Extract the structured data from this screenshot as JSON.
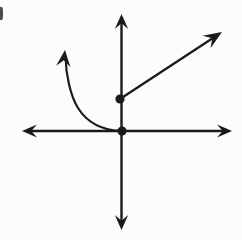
{
  "figure": {
    "kind": "coordinate-plane-graph",
    "width": 242,
    "height": 240,
    "background_color": "#fcfcfb",
    "ink_color": "#1a1a1a",
    "stroke_width": 2.2
  },
  "axes": {
    "origin": {
      "x": 121.5,
      "y": 131
    },
    "x_axis": {
      "label": "x-axis",
      "y": 131,
      "left_tip": {
        "x": 22,
        "y": 131
      },
      "right_tip": {
        "x": 232,
        "y": 131
      },
      "arrow_left": true,
      "arrow_right": true
    },
    "y_axis": {
      "label": "y-axis",
      "x": 121.5,
      "top_tip": {
        "x": 121.5,
        "y": 14
      },
      "bottom_tip": {
        "x": 121.5,
        "y": 230
      },
      "arrow_top": true,
      "arrow_bottom": true
    }
  },
  "points": [
    {
      "name": "origin-point",
      "x": 122,
      "y": 131,
      "radius": 4.6,
      "filled": true,
      "color": "#1a1a1a"
    },
    {
      "name": "y-intercept-point",
      "x": 120,
      "y": 99,
      "radius": 4.6,
      "filled": true,
      "color": "#1a1a1a"
    }
  ],
  "curves": [
    {
      "name": "exponential-decay-curve",
      "description": "Curve beginning at the origin, sweeping left nearly tangent to the x-axis, then rising steeply into the second quadrant with an arrowhead",
      "quadrant": "second",
      "path": "M 122 131 C 104 130.5 88 124 78 108 C 70 95 66 74 65.5 57",
      "arrow_end": true,
      "arrow_tip": {
        "x": 65,
        "y": 50
      },
      "arrow_angle_deg": -84
    },
    {
      "name": "linear-ray",
      "description": "Straight ray from the y-intercept point rising to the right with an arrowhead",
      "quadrant": "first",
      "path": "M 120 99 L 216 36",
      "arrow_end": true,
      "arrow_tip": {
        "x": 222,
        "y": 32
      },
      "arrow_angle_deg": -33
    }
  ],
  "artifacts": {
    "left_edge_mark": {
      "name": "cropped-label-fragment",
      "visible": true,
      "description": "Partial dark mark clipped at the left edge near the top"
    }
  }
}
